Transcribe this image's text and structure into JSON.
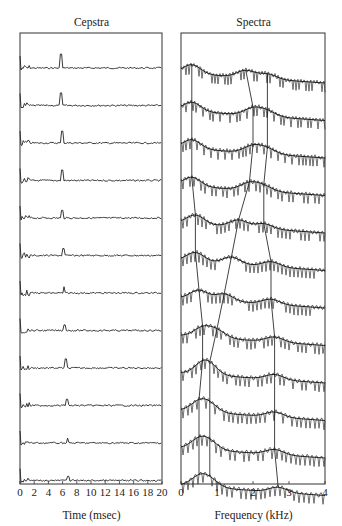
{
  "chart_data": [
    {
      "type": "line",
      "title": "Cepstra",
      "xlabel": "Time (msec)",
      "ylabel": "",
      "xlim": [
        0,
        20
      ],
      "x_ticks": [
        "0",
        "2",
        "4",
        "6",
        "8",
        "10",
        "12",
        "14",
        "16",
        "18",
        "20"
      ],
      "grid": false,
      "n_traces": 12,
      "description": "Stacked cepstra for 12 successive frames; each shows a pitch peak that drifts from ~6 ms (top) to ~7 ms (bottom)",
      "pitch_peak_msec": [
        5.8,
        5.8,
        5.9,
        5.9,
        6.0,
        6.1,
        6.2,
        6.3,
        6.5,
        6.6,
        6.7,
        6.8
      ],
      "pitch_peak_height": [
        1.0,
        0.9,
        0.85,
        0.75,
        0.55,
        0.5,
        0.45,
        0.4,
        0.65,
        0.45,
        0.35,
        0.3
      ]
    },
    {
      "type": "line",
      "title": "Spectra",
      "xlabel": "Frequency (kHz)",
      "ylabel": "",
      "xlim": [
        0,
        4
      ],
      "x_ticks": [
        "0",
        "1",
        "2",
        "3",
        "4"
      ],
      "grid": false,
      "n_traces": 12,
      "description": "Stacked log spectra with smoothed envelopes for 12 frames; lines connect formant peaks F1, F2, F3 across frames",
      "formant_tracks_khz": {
        "F1": [
          0.3,
          0.3,
          0.3,
          0.3,
          0.4,
          0.4,
          0.5,
          0.6,
          0.6,
          0.5,
          0.5,
          0.5
        ],
        "F2": [
          1.8,
          2.0,
          2.0,
          1.9,
          1.6,
          1.4,
          1.2,
          1.0,
          0.8,
          0.8,
          0.8,
          0.8
        ],
        "F3": [
          2.4,
          2.4,
          2.4,
          2.3,
          2.3,
          2.5,
          2.5,
          2.6,
          2.6,
          2.6,
          2.6,
          2.7
        ]
      }
    }
  ],
  "cepstra": {
    "title": "Cepstra",
    "xlabel": "Time (msec)",
    "ticks": [
      "0",
      "2",
      "4",
      "6",
      "8",
      "10",
      "12",
      "14",
      "16",
      "18",
      "20"
    ]
  },
  "spectra": {
    "title": "Spectra",
    "xlabel": "Frequency (kHz)",
    "ticks": [
      "0",
      "1",
      "2",
      "3",
      "4"
    ]
  }
}
